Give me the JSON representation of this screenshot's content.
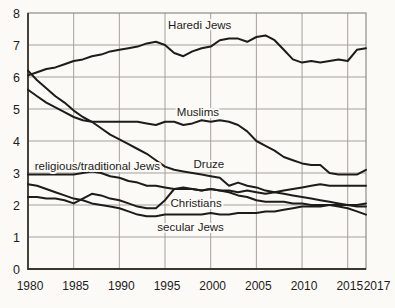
{
  "page": {
    "background": "#fbfaf7"
  },
  "chart_data": {
    "type": "line",
    "title": "",
    "xlabel": "",
    "ylabel": "",
    "ylim": [
      0,
      8
    ],
    "y_ticks": [
      0,
      1,
      2,
      3,
      4,
      5,
      6,
      7,
      8
    ],
    "x_ticks": [
      1980,
      1985,
      1990,
      1995,
      2000,
      2005,
      2010,
      2015,
      2017
    ],
    "x_tick_labels": [
      "1980",
      "1985",
      "1990",
      "1995",
      "2000",
      "2005",
      "2010",
      "2015",
      "2017"
    ],
    "grid": true,
    "legend_position": "inline-labels",
    "colors": {
      "background": "#fbfaf7",
      "grid": "#a5a19a",
      "border": "#8f8c85",
      "axis": "#3a372f",
      "line": "#1d1c1a",
      "text": "#1d1c1a"
    },
    "x": [
      1980,
      1981,
      1982,
      1983,
      1984,
      1985,
      1986,
      1987,
      1988,
      1989,
      1990,
      1991,
      1992,
      1993,
      1994,
      1995,
      1996,
      1997,
      1998,
      1999,
      2000,
      2001,
      2002,
      2003,
      2004,
      2005,
      2006,
      2007,
      2008,
      2009,
      2010,
      2011,
      2012,
      2013,
      2014,
      2015,
      2016,
      2017
    ],
    "series": [
      {
        "name": "Haredi Jews",
        "label": {
          "year": 1998.8,
          "value": 7.62
        },
        "values": [
          6.05,
          6.15,
          6.25,
          6.3,
          6.4,
          6.5,
          6.55,
          6.65,
          6.7,
          6.8,
          6.85,
          6.9,
          6.95,
          7.05,
          7.1,
          7.0,
          6.75,
          6.65,
          6.8,
          6.9,
          6.95,
          7.15,
          7.2,
          7.2,
          7.1,
          7.25,
          7.3,
          7.15,
          6.85,
          6.55,
          6.45,
          6.5,
          6.45,
          6.5,
          6.55,
          6.5,
          6.85,
          6.9
        ]
      },
      {
        "name": "Muslims",
        "label": {
          "year": 1998.6,
          "value": 4.9
        },
        "values": [
          5.6,
          5.4,
          5.2,
          5.05,
          4.9,
          4.75,
          4.65,
          4.6,
          4.6,
          4.6,
          4.6,
          4.6,
          4.6,
          4.55,
          4.5,
          4.6,
          4.6,
          4.5,
          4.55,
          4.65,
          4.6,
          4.65,
          4.6,
          4.5,
          4.3,
          4.0,
          3.85,
          3.7,
          3.5,
          3.4,
          3.3,
          3.25,
          3.25,
          3.0,
          2.95,
          2.95,
          2.95,
          3.1
        ]
      },
      {
        "name": "Druze",
        "label": {
          "year": 1999.8,
          "value": 3.28
        },
        "values": [
          6.2,
          5.9,
          5.65,
          5.4,
          5.2,
          4.95,
          4.75,
          4.6,
          4.4,
          4.2,
          4.05,
          3.9,
          3.75,
          3.6,
          3.4,
          3.2,
          3.1,
          3.05,
          3.0,
          2.95,
          2.9,
          2.85,
          2.6,
          2.7,
          2.6,
          2.55,
          2.45,
          2.4,
          2.35,
          2.3,
          2.25,
          2.2,
          2.15,
          2.1,
          2.05,
          2.0,
          1.95,
          1.95
        ]
      },
      {
        "name": "religious/traditional Jews",
        "label": {
          "year": 1987.6,
          "value": 3.22
        },
        "values": [
          2.95,
          2.95,
          2.95,
          2.95,
          2.95,
          2.95,
          3.0,
          3.05,
          3.0,
          2.9,
          2.85,
          2.75,
          2.7,
          2.6,
          2.6,
          2.55,
          2.5,
          2.5,
          2.5,
          2.45,
          2.5,
          2.45,
          2.45,
          2.4,
          2.45,
          2.4,
          2.35,
          2.4,
          2.45,
          2.5,
          2.55,
          2.6,
          2.65,
          2.6,
          2.6,
          2.6,
          2.6,
          2.6
        ]
      },
      {
        "name": "Christians",
        "label": {
          "year": 1998.4,
          "value": 2.06
        },
        "values": [
          2.25,
          2.25,
          2.2,
          2.2,
          2.15,
          2.05,
          2.2,
          2.35,
          2.3,
          2.2,
          2.15,
          2.05,
          1.95,
          1.9,
          1.9,
          2.15,
          2.5,
          2.55,
          2.5,
          2.45,
          2.5,
          2.45,
          2.4,
          2.3,
          2.25,
          2.15,
          2.1,
          2.1,
          2.1,
          2.05,
          2.05,
          2.0,
          2.0,
          2.0,
          1.95,
          1.9,
          1.8,
          1.7
        ]
      },
      {
        "name": "secular Jews",
        "label": {
          "year": 1997.8,
          "value": 1.3
        },
        "values": [
          2.65,
          2.6,
          2.5,
          2.4,
          2.3,
          2.2,
          2.15,
          2.05,
          2.0,
          1.95,
          1.9,
          1.8,
          1.7,
          1.65,
          1.65,
          1.7,
          1.7,
          1.7,
          1.7,
          1.7,
          1.75,
          1.7,
          1.7,
          1.75,
          1.75,
          1.75,
          1.8,
          1.8,
          1.85,
          1.9,
          1.95,
          1.95,
          1.95,
          2.0,
          2.0,
          2.0,
          2.0,
          2.05
        ]
      }
    ]
  }
}
